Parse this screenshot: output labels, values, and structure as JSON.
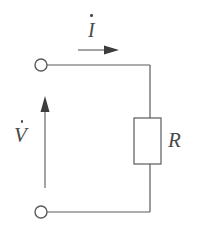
{
  "figure": {
    "canvas": {
      "width": 199,
      "height": 238,
      "background": "#ffffff"
    },
    "stroke_color": "#5a5a5a",
    "label_color": "#4a4a4a"
  },
  "labels": {
    "current": {
      "symbol": "I",
      "accent": "dot",
      "name": "current-phasor-label"
    },
    "voltage": {
      "symbol": "V",
      "accent": "dot",
      "name": "voltage-phasor-label"
    },
    "resistor": {
      "symbol": "R",
      "accent": "none",
      "name": "resistor-label"
    }
  },
  "components": {
    "resistor": {
      "name": "resistor-body",
      "x": 134,
      "y": 118,
      "width": 27,
      "height": 46,
      "fill": "#ffffff"
    },
    "terminal_top": {
      "name": "terminal-top",
      "cx": 41,
      "cy": 65,
      "r": 6
    },
    "terminal_bottom": {
      "name": "terminal-bottom",
      "cx": 41,
      "cy": 212,
      "r": 6
    }
  },
  "wires": {
    "top": {
      "x1": 47,
      "y1": 65,
      "x2": 150,
      "y2": 65
    },
    "bottom": {
      "x1": 47,
      "y1": 212,
      "x2": 150,
      "y2": 212
    },
    "right_upper": {
      "x1": 150,
      "y1": 65,
      "x2": 150,
      "y2": 118
    },
    "right_lower": {
      "x1": 150,
      "y1": 164,
      "x2": 150,
      "y2": 212
    }
  },
  "arrows": {
    "current": {
      "name": "current-direction-arrow",
      "direction": "right",
      "x1": 78,
      "y1": 50,
      "x2": 118,
      "y2": 50
    },
    "voltage": {
      "name": "voltage-direction-arrow",
      "direction": "up",
      "x1": 45,
      "y1": 188,
      "x2": 45,
      "y2": 97
    }
  }
}
